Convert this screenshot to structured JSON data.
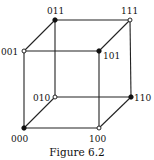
{
  "figure": {
    "caption": "Figure 6.2",
    "type": "cube graph of 3-bit binary strings",
    "colors": {
      "edge": "#222222",
      "background": "#ffffff"
    },
    "vertices": [
      {
        "id": "000",
        "label": "000",
        "x": 24,
        "y": 128,
        "filled": true,
        "lx": 11,
        "ly": 142
      },
      {
        "id": "100",
        "label": "100",
        "x": 99,
        "y": 128,
        "filled": false,
        "lx": 89,
        "ly": 142
      },
      {
        "id": "010",
        "label": "010",
        "x": 55,
        "y": 97,
        "filled": false,
        "lx": 33,
        "ly": 101
      },
      {
        "id": "110",
        "label": "110",
        "x": 131,
        "y": 97,
        "filled": true,
        "lx": 134,
        "ly": 101
      },
      {
        "id": "001",
        "label": "001",
        "x": 24,
        "y": 51,
        "filled": false,
        "lx": 1,
        "ly": 55
      },
      {
        "id": "101",
        "label": "101",
        "x": 99,
        "y": 51,
        "filled": true,
        "lx": 103,
        "ly": 59
      },
      {
        "id": "011",
        "label": "011",
        "x": 55,
        "y": 20,
        "filled": true,
        "lx": 47,
        "ly": 14
      },
      {
        "id": "111",
        "label": "111",
        "x": 130,
        "y": 20,
        "filled": false,
        "lx": 121,
        "ly": 14
      }
    ],
    "edges": [
      [
        "000",
        "100"
      ],
      [
        "000",
        "010"
      ],
      [
        "000",
        "001"
      ],
      [
        "100",
        "110"
      ],
      [
        "100",
        "101"
      ],
      [
        "010",
        "110"
      ],
      [
        "010",
        "011"
      ],
      [
        "001",
        "101"
      ],
      [
        "001",
        "011"
      ],
      [
        "110",
        "111"
      ],
      [
        "101",
        "111"
      ],
      [
        "011",
        "111"
      ]
    ]
  }
}
